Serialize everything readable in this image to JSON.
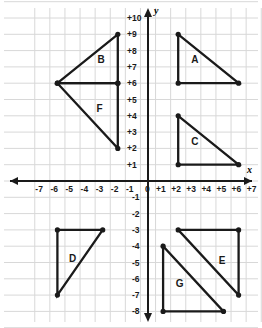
{
  "figure": {
    "title": "",
    "background_color": "#ffffff",
    "grid_color": "#d8d8d8",
    "axis_color": "#1a1a1a",
    "shape_color": "#1a1a1a"
  },
  "axes": {
    "x_label": "x",
    "y_label": "y",
    "x_min": -7,
    "x_max": 7,
    "y_min": -8,
    "y_max": 10,
    "x_tick_labels": [
      "-7",
      "-6",
      "-5",
      "-4",
      "-3",
      "-2",
      "-1",
      "0",
      "+1",
      "+2",
      "+3",
      "+4",
      "+5",
      "+6",
      "+7"
    ],
    "y_tick_labels_positive": [
      "+10",
      "+9",
      "+8",
      "+7",
      "+6",
      "+5",
      "+4",
      "+3",
      "+2",
      "+1"
    ],
    "y_tick_labels_negative": [
      "-1",
      "-2",
      "-3",
      "-4",
      "-5",
      "-6",
      "-7",
      "-8"
    ],
    "origin_label": "0",
    "grid": true,
    "arrows": [
      "left",
      "right",
      "up",
      "down"
    ]
  },
  "chart_data": {
    "type": "scatter",
    "title": "",
    "xlabel": "x",
    "ylabel": "y",
    "xlim": [
      -7,
      7
    ],
    "ylim": [
      -8,
      10
    ],
    "grid": true,
    "legend": "none",
    "shapes": [
      {
        "label": "A",
        "kind": "triangle",
        "vertices": [
          [
            2,
            9
          ],
          [
            2,
            6
          ],
          [
            6,
            6
          ]
        ],
        "label_pos": [
          3.1,
          7.4
        ]
      },
      {
        "label": "B",
        "kind": "triangle",
        "vertices": [
          [
            -6,
            6
          ],
          [
            -2,
            9
          ],
          [
            -2,
            6
          ]
        ],
        "label_pos": [
          -3.1,
          7.4
        ]
      },
      {
        "label": "C",
        "kind": "triangle",
        "vertices": [
          [
            2,
            4
          ],
          [
            2,
            1
          ],
          [
            6,
            1
          ]
        ],
        "label_pos": [
          3.1,
          2.4
        ]
      },
      {
        "label": "D",
        "kind": "triangle",
        "vertices": [
          [
            -6,
            -3
          ],
          [
            -3,
            -3
          ],
          [
            -6,
            -7
          ]
        ],
        "label_pos": [
          -5.0,
          -4.8
        ]
      },
      {
        "label": "E",
        "kind": "triangle",
        "vertices": [
          [
            2,
            -3
          ],
          [
            6,
            -3
          ],
          [
            6,
            -7
          ]
        ],
        "label_pos": [
          4.9,
          -4.9
        ]
      },
      {
        "label": "F",
        "kind": "triangle",
        "vertices": [
          [
            -6,
            6
          ],
          [
            -2,
            6
          ],
          [
            -2,
            2
          ]
        ],
        "label_pos": [
          -3.2,
          4.4
        ]
      },
      {
        "label": "G",
        "kind": "triangle",
        "vertices": [
          [
            1,
            -4
          ],
          [
            1,
            -8
          ],
          [
            5,
            -8
          ]
        ],
        "label_pos": [
          2.1,
          -6.3
        ]
      }
    ]
  }
}
